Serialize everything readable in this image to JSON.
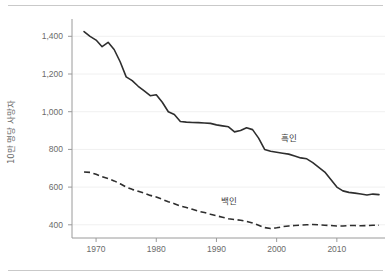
{
  "chart_data": {
    "type": "line",
    "title": "",
    "xlabel": "",
    "ylabel": "10만 명당 사망자",
    "xlim": [
      1966,
      2018
    ],
    "ylim": [
      330,
      1460
    ],
    "xticks": [
      "1970",
      "1980",
      "1990",
      "2000",
      "2010"
    ],
    "xtick_values": [
      1970,
      1980,
      1990,
      2000,
      2010
    ],
    "yticks": [
      "400",
      "600",
      "800",
      "1,000",
      "1,200",
      "1,400"
    ],
    "ytick_values": [
      400,
      600,
      800,
      1000,
      1200,
      1400
    ],
    "grid": true,
    "legend_position": "inline-annotation",
    "x": [
      1968,
      1969,
      1970,
      1971,
      1972,
      1973,
      1974,
      1975,
      1976,
      1977,
      1978,
      1979,
      1980,
      1981,
      1982,
      1983,
      1984,
      1985,
      1986,
      1987,
      1988,
      1989,
      1990,
      1991,
      1992,
      1993,
      1994,
      1995,
      1996,
      1997,
      1998,
      1999,
      2000,
      2001,
      2002,
      2003,
      2004,
      2005,
      2006,
      2007,
      2008,
      2009,
      2010,
      2011,
      2012,
      2013,
      2014,
      2015,
      2016,
      2017
    ],
    "series": [
      {
        "name": "흑인",
        "label": "흑인",
        "style": "solid",
        "color": "#2e2e2e",
        "label_x": 2002,
        "label_y": 845,
        "values": [
          1425,
          1400,
          1380,
          1345,
          1368,
          1330,
          1265,
          1185,
          1165,
          1135,
          1110,
          1085,
          1090,
          1050,
          1000,
          985,
          948,
          945,
          943,
          942,
          940,
          938,
          930,
          925,
          920,
          893,
          900,
          915,
          905,
          860,
          800,
          790,
          785,
          780,
          775,
          765,
          755,
          750,
          730,
          705,
          680,
          640,
          600,
          580,
          572,
          568,
          563,
          558,
          563,
          560
        ]
      },
      {
        "name": "백인",
        "label": "백인",
        "style": "dashed",
        "color": "#2e2e2e",
        "label_x": 1992,
        "label_y": 512,
        "values": [
          680,
          678,
          668,
          655,
          645,
          633,
          618,
          600,
          588,
          578,
          568,
          556,
          548,
          535,
          522,
          512,
          500,
          492,
          482,
          472,
          465,
          456,
          448,
          440,
          432,
          428,
          424,
          418,
          410,
          398,
          385,
          380,
          384,
          390,
          394,
          396,
          398,
          400,
          402,
          400,
          398,
          396,
          394,
          394,
          396,
          396,
          395,
          396,
          398,
          398
        ]
      }
    ]
  }
}
